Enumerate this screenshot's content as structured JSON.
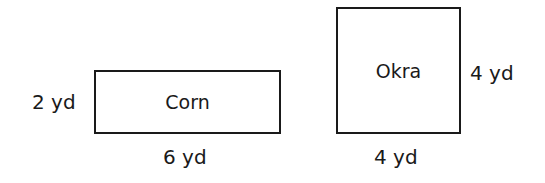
{
  "shapes": [
    {
      "name": "Corn",
      "kind": "rectangle",
      "width_label": "6 yd",
      "height_label": "2 yd"
    },
    {
      "name": "Okra",
      "kind": "square",
      "width_label": "4 yd",
      "height_label": "4 yd"
    }
  ],
  "colors": {
    "stroke": "#1a1a1a",
    "background": "#ffffff"
  }
}
